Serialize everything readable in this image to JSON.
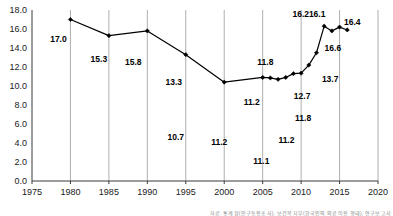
{
  "chart_data": {
    "type": "line",
    "title": "",
    "subtitle": "",
    "xlabel": "",
    "ylabel": "",
    "xlim": [
      1975,
      2020
    ],
    "ylim": [
      0.0,
      18.0
    ],
    "grid": true,
    "grid_orientation": "vertical",
    "legend": null,
    "legend_position": "none",
    "marker": "filled-diamond",
    "line_color": "#000000",
    "x": [
      1980,
      1985,
      1990,
      1995,
      2000,
      2005,
      2006,
      2007,
      2008,
      2009,
      2010,
      2011,
      2012,
      2013,
      2014,
      2015,
      2016
    ],
    "values": [
      17.0,
      15.3,
      15.8,
      13.3,
      10.4,
      10.9,
      10.85,
      10.7,
      10.9,
      11.3,
      11.35,
      12.2,
      13.5,
      16.3,
      15.8,
      16.2,
      15.9
    ],
    "x_ticks": [
      "1975",
      "1980",
      "1985",
      "1990",
      "1995",
      "2000",
      "2005",
      "2010",
      "2015",
      "2020"
    ],
    "x_tick_values": [
      1975,
      1980,
      1985,
      1990,
      1995,
      2000,
      2005,
      2010,
      2015,
      2020
    ],
    "y_ticks": [
      "0.0",
      "2.0",
      "4.0",
      "6.0",
      "8.0",
      "10.0",
      "12.0",
      "14.0",
      "16.0",
      "18.0"
    ],
    "y_tick_values": [
      0.0,
      2.0,
      4.0,
      6.0,
      8.0,
      10.0,
      12.0,
      14.0,
      16.0,
      18.0
    ],
    "annotations": [
      {
        "text": "17.0",
        "x": 1980,
        "y": 17.0,
        "dx": -12,
        "dy": 22
      },
      {
        "text": "15.3",
        "x": 1985,
        "y": 15.3,
        "dx": -10,
        "dy": 26
      },
      {
        "text": "15.8",
        "x": 1990,
        "y": 15.8,
        "dx": -14,
        "dy": 34
      },
      {
        "text": "13.3",
        "x": 1995,
        "y": 13.3,
        "dx": -12,
        "dy": 30
      },
      {
        "text": "10.7",
        "x": 1995,
        "y": 13.3,
        "dx": -10,
        "dy": 85
      },
      {
        "text": "11.2",
        "x": 2000,
        "y": 10.4,
        "dx": -5,
        "dy": 63
      },
      {
        "text": "11.2",
        "x": 2005,
        "y": 10.9,
        "dx": -11,
        "dy": 28
      },
      {
        "text": "11.8",
        "x": 2006,
        "y": 10.85,
        "dx": -5,
        "dy": -13
      },
      {
        "text": "11.1",
        "x": 2006,
        "y": 10.85,
        "dx": -9,
        "dy": 86
      },
      {
        "text": "11.2",
        "x": 2009,
        "y": 11.3,
        "dx": -7,
        "dy": 69
      },
      {
        "text": "12.7",
        "x": 2010,
        "y": 11.35,
        "dx": 1,
        "dy": 26
      },
      {
        "text": "11.8",
        "x": 2010,
        "y": 11.35,
        "dx": 2,
        "dy": 48
      },
      {
        "text": "16.2",
        "x": 2011,
        "y": 12.2,
        "dx": -8,
        "dy": -48
      },
      {
        "text": "16.1",
        "x": 2013,
        "y": 16.3,
        "dx": -7,
        "dy": -9
      },
      {
        "text": "13.7",
        "x": 2013,
        "y": 16.3,
        "dx": 6,
        "dy": 56
      },
      {
        "text": "16.6",
        "x": 2014,
        "y": 15.8,
        "dx": 1,
        "dy": 20
      },
      {
        "text": "16.4",
        "x": 2016,
        "y": 15.9,
        "dx": 5,
        "dy": -5
      }
    ],
    "footnote": "자료: 통계청(인구동향조사), 보건복지부(한국인의 의료이용 행태), 연구보고서"
  }
}
